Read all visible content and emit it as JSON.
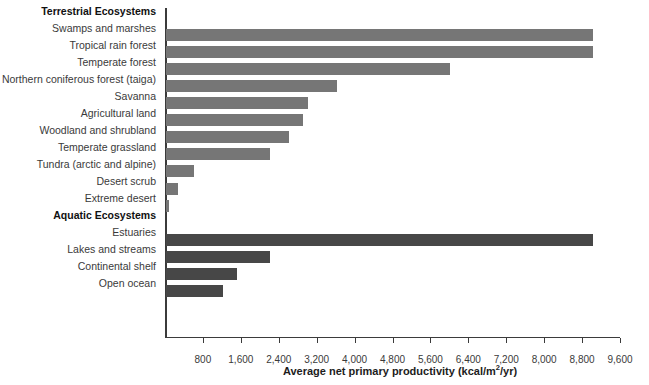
{
  "chart_data": {
    "type": "bar",
    "orientation": "horizontal",
    "title": "",
    "xlabel": "Average net primary productivity (kcal/m2/yr)",
    "ylabel": "",
    "xlim": [
      0,
      9600
    ],
    "xticks": [
      800,
      1600,
      2400,
      3200,
      4000,
      4800,
      5600,
      6400,
      7200,
      8000,
      8800,
      9600
    ],
    "xtick_labels": [
      "800",
      "1,600",
      "2,400",
      "3,200",
      "4,000",
      "4,800",
      "5,600",
      "6,400",
      "7,200",
      "8,000",
      "8,800",
      "9,600"
    ],
    "grid": false,
    "legend": "none",
    "groups": [
      {
        "name": "Terrestrial Ecosystems",
        "color": "#767676",
        "categories": [
          "Swamps and marshes",
          "Tropical rain forest",
          "Temperate forest",
          "Northern coniferous forest (taiga)",
          "Savanna",
          "Agricultural land",
          "Woodland and shrubland",
          "Temperate grassland",
          "Tundra (arctic and alpine)",
          "Desert scrub",
          "Extreme desert"
        ],
        "values": [
          9000,
          9000,
          6000,
          3600,
          3000,
          2900,
          2600,
          2200,
          600,
          250,
          70
        ]
      },
      {
        "name": "Aquatic Ecosystems",
        "color": "#474747",
        "categories": [
          "Estuaries",
          "Lakes and streams",
          "Continental shelf",
          "Open ocean"
        ],
        "values": [
          9000,
          2200,
          1500,
          1200
        ]
      }
    ]
  },
  "axis": {
    "title_main": "Average net primary productivity (kcal/m",
    "title_sup": "2",
    "title_tail": "/yr)"
  }
}
